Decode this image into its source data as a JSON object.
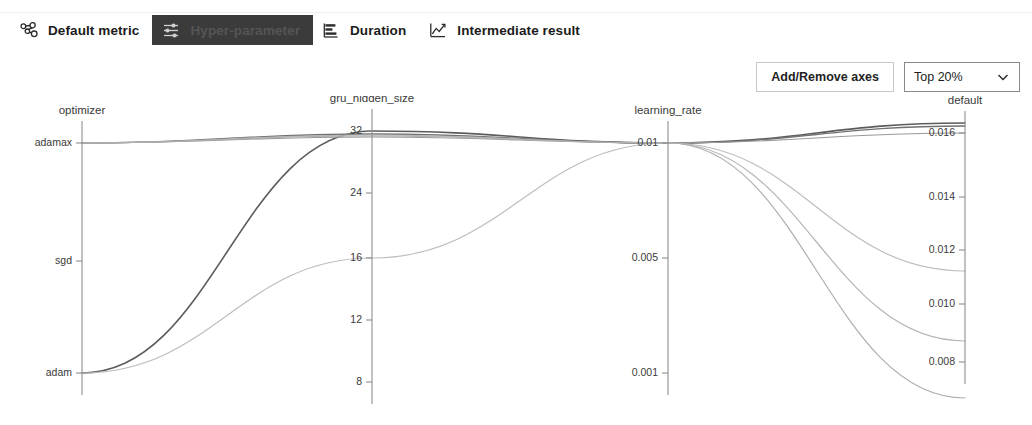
{
  "header": {
    "tabs": [
      {
        "label": "Default metric",
        "icon": "nodes-graph-icon",
        "selected": false
      },
      {
        "label": "Hyper-parameter",
        "icon": "sliders-icon",
        "selected": true
      },
      {
        "label": "Duration",
        "icon": "bar-list-icon",
        "selected": false
      },
      {
        "label": "Intermediate result",
        "icon": "line-chart-icon",
        "selected": false
      }
    ]
  },
  "controls": {
    "add_remove_axes_label": "Add/Remove axes",
    "filter_selected": "Top 20%",
    "filter_options": [
      "Top 20%"
    ],
    "chevron_icon": "chevron-down-icon"
  },
  "colors": {
    "selected_tab_bg": "#3b3b3b",
    "axis": "#8e8e8e",
    "text": "#1b1b1b",
    "line_dark": "#5c5c5c",
    "line_mid": "#8f8f8f",
    "line_light": "#bdbdbd"
  },
  "chart_data": {
    "type": "line",
    "subtype": "parallel-coordinates",
    "title": "",
    "grid": false,
    "legend": false,
    "axes": [
      {
        "name": "optimizer",
        "x": 82,
        "scale": "categorical",
        "ticks": [
          {
            "label": "adamax",
            "y": 143
          },
          {
            "label": "sgd",
            "y": 261
          },
          {
            "label": "adam",
            "y": 373
          }
        ]
      },
      {
        "name": "gru_hidden_size",
        "x": 372,
        "scale": "linear",
        "ticks": [
          {
            "label": "32",
            "y": 131
          },
          {
            "label": "24",
            "y": 193
          },
          {
            "label": "16",
            "y": 258
          },
          {
            "label": "12",
            "y": 320
          },
          {
            "label": "8",
            "y": 382
          }
        ]
      },
      {
        "name": "learning_rate",
        "x": 668,
        "scale": "linear",
        "ticks": [
          {
            "label": "0.01",
            "y": 143
          },
          {
            "label": "0.005",
            "y": 258
          },
          {
            "label": "0.001",
            "y": 373
          }
        ]
      },
      {
        "name": "default",
        "x": 965,
        "scale": "linear",
        "ticks": [
          {
            "label": "0.016",
            "y": 133
          },
          {
            "label": "0.014",
            "y": 197
          },
          {
            "label": "0.012",
            "y": 250
          },
          {
            "label": "0.010",
            "y": 304
          },
          {
            "label": "0.008",
            "y": 362
          }
        ]
      }
    ],
    "series": [
      {
        "name": "trial-1",
        "color": "#5c5c5c",
        "width": 1.6,
        "values": {
          "optimizer": "adam",
          "gru_hidden_size": 32,
          "learning_rate": 0.01,
          "default": 0.0172
        },
        "points": [
          [
            82,
            373
          ],
          [
            372,
            131
          ],
          [
            668,
            143
          ],
          [
            965,
            123
          ]
        ]
      },
      {
        "name": "trial-2",
        "color": "#707070",
        "width": 1.3,
        "values": {
          "optimizer": "adamax",
          "gru_hidden_size": 32,
          "learning_rate": 0.01,
          "default": 0.017
        },
        "points": [
          [
            82,
            143
          ],
          [
            372,
            134
          ],
          [
            668,
            143
          ],
          [
            965,
            126
          ]
        ]
      },
      {
        "name": "trial-3",
        "color": "#9a9a9a",
        "width": 1.2,
        "values": {
          "optimizer": "adamax",
          "gru_hidden_size": 32,
          "learning_rate": 0.01,
          "default": 0.0166
        },
        "points": [
          [
            82,
            143
          ],
          [
            372,
            137
          ],
          [
            668,
            143
          ],
          [
            965,
            133
          ]
        ]
      },
      {
        "name": "trial-4",
        "color": "#bdbdbd",
        "width": 1.2,
        "values": {
          "optimizer": "adam",
          "gru_hidden_size": 16,
          "learning_rate": 0.01,
          "default": 0.0114
        },
        "points": [
          [
            82,
            373
          ],
          [
            372,
            258
          ],
          [
            668,
            143
          ],
          [
            965,
            271
          ]
        ]
      },
      {
        "name": "trial-5",
        "color": "#b5b5b5",
        "width": 1.2,
        "values": {
          "optimizer": "adamax",
          "gru_hidden_size": 32,
          "learning_rate": 0.01,
          "default": 0.0087
        },
        "points": [
          [
            82,
            143
          ],
          [
            372,
            135
          ],
          [
            668,
            143
          ],
          [
            965,
            341
          ]
        ]
      },
      {
        "name": "trial-6",
        "color": "#aeaeae",
        "width": 1.2,
        "values": {
          "optimizer": "adamax",
          "gru_hidden_size": 32,
          "learning_rate": 0.01,
          "default": 0.0068
        },
        "points": [
          [
            82,
            143
          ],
          [
            372,
            136
          ],
          [
            668,
            143
          ],
          [
            965,
            398
          ]
        ]
      }
    ],
    "xlabel": "",
    "ylabel": ""
  }
}
